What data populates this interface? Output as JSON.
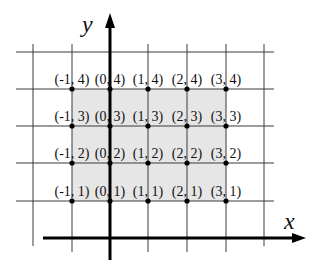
{
  "diagram": {
    "axes": {
      "x_label": "x",
      "y_label": "y"
    },
    "colors": {
      "shade": "#e6e6e6",
      "grid": "#3a3a3a",
      "axis": "#000000",
      "point": "#000000"
    },
    "grid": {
      "vertical_lines_x": [
        33,
        72,
        110,
        148,
        187,
        226,
        264
      ],
      "horizontal_lines_y": [
        52,
        89,
        126,
        163,
        201
      ],
      "shaded_region": {
        "x_from": -1,
        "x_to": 3,
        "y_from": 1,
        "y_to": 4
      }
    },
    "points": [
      {
        "label": "(-1, 4)",
        "x": -1,
        "y": 4
      },
      {
        "label": "(0, 4)",
        "x": 0,
        "y": 4
      },
      {
        "label": "(1, 4)",
        "x": 1,
        "y": 4
      },
      {
        "label": "(2, 4)",
        "x": 2,
        "y": 4
      },
      {
        "label": "(3, 4)",
        "x": 3,
        "y": 4
      },
      {
        "label": "(-1, 3)",
        "x": -1,
        "y": 3
      },
      {
        "label": "(0, 3)",
        "x": 0,
        "y": 3
      },
      {
        "label": "(1, 3)",
        "x": 1,
        "y": 3
      },
      {
        "label": "(2, 3)",
        "x": 2,
        "y": 3
      },
      {
        "label": "(3, 3)",
        "x": 3,
        "y": 3
      },
      {
        "label": "(-1, 2)",
        "x": -1,
        "y": 2
      },
      {
        "label": "(0, 2)",
        "x": 0,
        "y": 2
      },
      {
        "label": "(1, 2)",
        "x": 1,
        "y": 2
      },
      {
        "label": "(2, 2)",
        "x": 2,
        "y": 2
      },
      {
        "label": "(3, 2)",
        "x": 3,
        "y": 2
      },
      {
        "label": "(-1, 1)",
        "x": -1,
        "y": 1
      },
      {
        "label": "(0, 1)",
        "x": 0,
        "y": 1
      },
      {
        "label": "(1, 1)",
        "x": 1,
        "y": 1
      },
      {
        "label": "(2, 1)",
        "x": 2,
        "y": 1
      },
      {
        "label": "(3, 1)",
        "x": 3,
        "y": 1
      }
    ]
  }
}
